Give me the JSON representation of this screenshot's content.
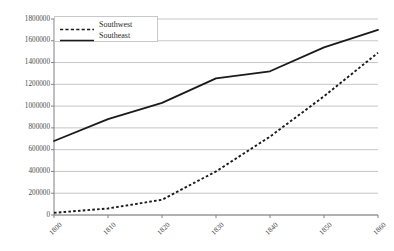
{
  "chart_data": {
    "type": "line",
    "title": "",
    "xlabel": "",
    "ylabel": "",
    "x": [
      1800,
      1810,
      1820,
      1830,
      1840,
      1850,
      1860
    ],
    "categories": [
      "1800",
      "1810",
      "1820",
      "1830",
      "1840",
      "1850",
      "1860"
    ],
    "ylim": [
      0,
      1800000
    ],
    "ytick_values": [
      0,
      200000,
      400000,
      600000,
      800000,
      1000000,
      1200000,
      1400000,
      1600000,
      1800000
    ],
    "ytick_labels": [
      "0",
      "200000",
      "400000",
      "600000",
      "800000",
      "1000000",
      "1200000",
      "1400000",
      "1600000",
      "1800000"
    ],
    "grid": true,
    "legend_position": "top-left",
    "series": [
      {
        "name": "Southwest",
        "style": "dashed",
        "color": "#1a1a1a",
        "values": [
          20000,
          60000,
          140000,
          400000,
          720000,
          1090000,
          1490000
        ]
      },
      {
        "name": "Southeast",
        "style": "solid",
        "color": "#1a1a1a",
        "values": [
          680000,
          880000,
          1030000,
          1255000,
          1320000,
          1540000,
          1700000
        ]
      }
    ]
  },
  "legend": {
    "items": [
      {
        "label": "Southwest",
        "style": "dashed"
      },
      {
        "label": "Southeast",
        "style": "solid"
      }
    ]
  },
  "colors": {
    "grid": "#c0c0c0",
    "axis": "#808080",
    "line": "#1a1a1a",
    "text": "#4a4a4a",
    "background": "#ffffff"
  }
}
